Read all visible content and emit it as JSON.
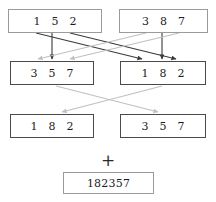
{
  "diagram": {
    "colors": {
      "dark_arrow": "#3a3a3a",
      "light_arrow": "#c0c0c0",
      "box_border_light": "#9b9b9b",
      "box_border_dark": "#4a4a4a",
      "text": "#1c1c1c",
      "background": "#ffffff"
    },
    "rows": {
      "top": {
        "left_box": {
          "name": "top-left-box",
          "digits": [
            "1",
            "5",
            "2"
          ],
          "border": "light"
        },
        "right_box": {
          "name": "top-right-box",
          "digits": [
            "3",
            "8",
            "7"
          ],
          "border": "light"
        }
      },
      "middle": {
        "left_box": {
          "name": "middle-left-box",
          "digits": [
            "3",
            "5",
            "7"
          ],
          "border": "dark"
        },
        "right_box": {
          "name": "middle-right-box",
          "digits": [
            "1",
            "8",
            "2"
          ],
          "border": "dark"
        }
      },
      "bottom": {
        "left_box": {
          "name": "bottom-left-box",
          "digits": [
            "1",
            "8",
            "2"
          ],
          "border": "dark"
        },
        "right_box": {
          "name": "bottom-right-box",
          "digits": [
            "3",
            "5",
            "7"
          ],
          "border": "dark"
        }
      }
    },
    "operator": "+",
    "result": {
      "name": "result-box",
      "value": "182357",
      "border": "light"
    }
  }
}
